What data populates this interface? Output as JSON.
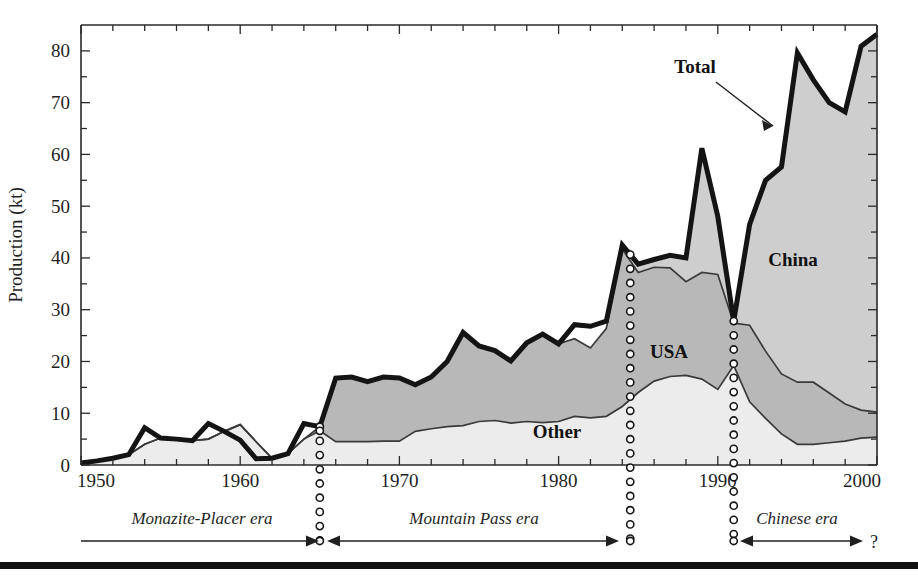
{
  "chart_data": {
    "type": "area",
    "title": "",
    "xlabel": "",
    "ylabel": "Production (kt)",
    "xlim": [
      1950,
      2000
    ],
    "ylim": [
      0,
      85
    ],
    "y_ticks_major": [
      0,
      10,
      20,
      30,
      40,
      50,
      60,
      70,
      80
    ],
    "y_ticks_minor_step": 5,
    "x_ticks_major": [
      1950,
      1960,
      1970,
      1980,
      1990,
      2000
    ],
    "x_ticks_minor_step": 2,
    "grid": false,
    "legend_position": "in-plot-annotations",
    "stacked": true,
    "stack_order_bottom_to_top": [
      "Other",
      "USA",
      "China"
    ],
    "x": [
      1950,
      1951,
      1952,
      1953,
      1954,
      1955,
      1956,
      1957,
      1958,
      1959,
      1960,
      1961,
      1962,
      1963,
      1964,
      1965,
      1966,
      1967,
      1968,
      1969,
      1970,
      1971,
      1972,
      1973,
      1974,
      1975,
      1976,
      1977,
      1978,
      1979,
      1980,
      1981,
      1982,
      1983,
      1984,
      1985,
      1986,
      1987,
      1988,
      1989,
      1990,
      1991,
      1992,
      1993,
      1994,
      1995,
      1996,
      1997,
      1998,
      1999,
      2000
    ],
    "series": [
      {
        "name": "Other",
        "color": "#ececec",
        "values": [
          0.4,
          0.8,
          1.3,
          2.0,
          4.0,
          5.2,
          5.0,
          4.7,
          5.0,
          6.5,
          7.8,
          4.5,
          1.3,
          2.2,
          5.0,
          6.6,
          4.5,
          4.5,
          4.5,
          4.6,
          4.6,
          6.5,
          7.0,
          7.4,
          7.6,
          8.4,
          8.6,
          8.1,
          8.4,
          8.2,
          8.4,
          9.4,
          9.1,
          9.4,
          11.3,
          14.0,
          16.2,
          17.1,
          17.3,
          16.6,
          14.6,
          19.2,
          12.2,
          9.0,
          6.0,
          4.0,
          4.0,
          4.3,
          4.6,
          5.2,
          5.4
        ]
      },
      {
        "name": "USA",
        "color": "#b8b8b8",
        "values": [
          0.0,
          0.0,
          0.0,
          0.0,
          0.0,
          0.0,
          0.0,
          0.0,
          0.0,
          0.0,
          0.0,
          0.0,
          0.0,
          0.0,
          0.0,
          0.8,
          12.3,
          12.5,
          11.6,
          12.4,
          12.2,
          9.0,
          10.0,
          12.6,
          18.0,
          14.6,
          13.5,
          12.0,
          15.2,
          17.1,
          15.0,
          15.0,
          13.5,
          17.0,
          30.4,
          23.2,
          22.0,
          21.0,
          18.1,
          20.6,
          22.2,
          8.2,
          14.8,
          13.0,
          11.6,
          12.0,
          12.0,
          9.6,
          7.2,
          5.4,
          4.8
        ]
      },
      {
        "name": "China",
        "color": "#cecece",
        "values": [
          0.0,
          0.0,
          0.0,
          0.0,
          0.0,
          0.0,
          0.0,
          0.0,
          0.0,
          0.0,
          0.0,
          0.0,
          0.0,
          0.0,
          0.0,
          0.0,
          0.0,
          0.0,
          0.0,
          0.0,
          0.0,
          0.0,
          0.0,
          0.0,
          0.0,
          0.0,
          0.0,
          0.0,
          0.0,
          0.0,
          0.0,
          0.0,
          0.0,
          0.0,
          0.8,
          1.6,
          1.5,
          2.4,
          4.6,
          24.0,
          11.2,
          0.4,
          19.5,
          33.0,
          40.0,
          63.6,
          58.4,
          56.1,
          56.4,
          70.3,
          73.0
        ]
      }
    ],
    "total": {
      "name": "Total",
      "values": [
        0.4,
        0.8,
        1.3,
        2.0,
        7.2,
        5.2,
        5.0,
        4.7,
        8.0,
        6.5,
        4.8,
        1.2,
        1.3,
        2.2,
        8.0,
        7.4,
        16.8,
        17.0,
        16.1,
        17.0,
        16.8,
        15.5,
        17.0,
        20.0,
        25.6,
        23.0,
        22.1,
        20.1,
        23.6,
        25.3,
        23.4,
        27.1,
        26.8,
        27.8,
        42.5,
        38.8,
        39.7,
        40.5,
        40.0,
        61.2,
        48.0,
        27.8,
        46.5,
        55.0,
        57.6,
        79.6,
        74.4,
        70.0,
        68.2,
        80.9,
        83.2
      ]
    },
    "annotations": [
      {
        "name": "total-annotation",
        "text": "Total",
        "x": 1986.6,
        "y": 71.0
      },
      {
        "name": "china-annotation",
        "text": "China",
        "x": 1992.8,
        "y": 42.0
      },
      {
        "name": "usa-annotation",
        "text": "USA",
        "x": 1986.0,
        "y": 22.5
      },
      {
        "name": "other-annotation",
        "text": "Other",
        "x": 1979.8,
        "y": 7.0
      }
    ],
    "era_dividers": [
      1965,
      1984.5,
      1991
    ],
    "eras": [
      {
        "name": "monazite-placer-era",
        "label": "Monazite-Placer era",
        "start": 1950,
        "end": 1965,
        "arrow": "right"
      },
      {
        "name": "mountain-pass-era",
        "label": "Mountain Pass era",
        "start": 1965,
        "end": 1984.5,
        "arrow": "both-ends"
      },
      {
        "name": "chinese-era",
        "label": "Chinese era",
        "start": 1991,
        "end": 2000,
        "arrow": "both-ends",
        "suffix": "?"
      }
    ]
  },
  "axes": {
    "y_label": "Production (kt)",
    "y_tick_labels": [
      "0",
      "10",
      "20",
      "30",
      "40",
      "50",
      "60",
      "70",
      "80"
    ],
    "x_tick_labels": [
      "1950",
      "1960",
      "1970",
      "1980",
      "1990",
      "2000"
    ]
  },
  "labels": {
    "total": "Total",
    "china": "China",
    "usa": "USA",
    "other": "Other",
    "era_1": "Monazite-Placer era",
    "era_2": "Mountain Pass era",
    "era_3": "Chinese era",
    "future_marker": "?"
  },
  "colors": {
    "other_fill": "#ececec",
    "usa_fill": "#b8b8b8",
    "china_fill": "#cecece",
    "total_stroke": "#141414",
    "axis": "#2a2a2a",
    "background": "#ffffff"
  }
}
